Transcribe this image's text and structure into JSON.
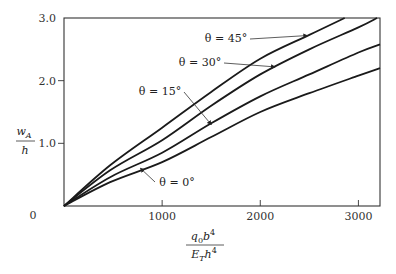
{
  "chart_data": {
    "type": "line",
    "title": "",
    "xlabel": {
      "numerator": "q0 b^4",
      "denominator": "E_T h^4"
    },
    "ylabel": {
      "numerator": "w_A",
      "denominator": "h"
    },
    "xlim": [
      0,
      3220
    ],
    "ylim": [
      0,
      3.0
    ],
    "grid": false,
    "origin_label": "0",
    "x_ticks": [
      {
        "value": 1000,
        "label": "1000"
      },
      {
        "value": 2000,
        "label": "2000"
      },
      {
        "value": 3000,
        "label": "3000"
      }
    ],
    "y_ticks": [
      {
        "value": 1.0,
        "label": "1.0"
      },
      {
        "value": 2.0,
        "label": "2.0"
      },
      {
        "value": 3.0,
        "label": "3.0"
      }
    ],
    "series": [
      {
        "name": "θ = 45°",
        "x": [
          0,
          470,
          1000,
          1500,
          2000,
          2500,
          2860
        ],
        "y": [
          0,
          0.65,
          1.25,
          1.82,
          2.35,
          2.73,
          3.0
        ],
        "annotation": {
          "text": "θ = 45°",
          "anchor_x": 2480,
          "anchor_y": 2.72
        }
      },
      {
        "name": "θ = 30°",
        "x": [
          0,
          470,
          1000,
          1500,
          2000,
          2500,
          3000,
          3190
        ],
        "y": [
          0,
          0.57,
          1.05,
          1.6,
          2.1,
          2.5,
          2.85,
          3.0
        ],
        "annotation": {
          "text": "θ = 30°",
          "anchor_x": 2150,
          "anchor_y": 2.22
        }
      },
      {
        "name": "θ = 15°",
        "x": [
          0,
          470,
          1000,
          1500,
          2000,
          2500,
          3000,
          3220
        ],
        "y": [
          0,
          0.46,
          0.85,
          1.32,
          1.75,
          2.1,
          2.45,
          2.58
        ],
        "annotation": {
          "text": "θ = 15°",
          "anchor_x": 1500,
          "anchor_y": 1.3
        }
      },
      {
        "name": "θ = 0°",
        "x": [
          0,
          470,
          1000,
          1500,
          2000,
          2500,
          3000,
          3220
        ],
        "y": [
          0,
          0.38,
          0.7,
          1.1,
          1.5,
          1.8,
          2.08,
          2.2
        ],
        "annotation": {
          "text": "θ = 0°",
          "anchor_x": 780,
          "anchor_y": 0.6
        }
      }
    ]
  }
}
